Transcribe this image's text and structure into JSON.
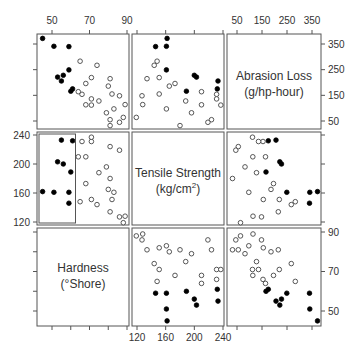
{
  "chart_data": {
    "type": "scatter",
    "subtype": "scatterplot-matrix",
    "title": "",
    "variables": [
      {
        "key": "hardness",
        "label": "Hardness",
        "unit_label": "(°Shore)",
        "ticks": [
          50,
          70,
          90
        ],
        "range": [
          42,
          92
        ]
      },
      {
        "key": "tensile",
        "label": "Tensile Strength",
        "unit_label": "(kg/cm²)",
        "ticks": [
          120,
          160,
          200,
          240
        ],
        "range": [
          112,
          245
        ]
      },
      {
        "key": "abrasion",
        "label": "Abrasion Loss",
        "unit_label": "(g/hp-hour)",
        "ticks": [
          50,
          150,
          250,
          350
        ],
        "range": [
          20,
          390
        ]
      }
    ],
    "diagonal_order": [
      "abrasion",
      "tensile",
      "hardness"
    ],
    "column_order": [
      "hardness",
      "tensile",
      "abrasion"
    ],
    "brush": {
      "variable": "hardness",
      "max": 62,
      "panel": "tensile-vs-hardness"
    },
    "point_style": {
      "selected": "filled",
      "unselected": "open"
    },
    "points": [
      {
        "abrasion": 372,
        "hardness": 45,
        "tensile": 162
      },
      {
        "abrasion": 206,
        "hardness": 55,
        "tensile": 233
      },
      {
        "abrasion": 175,
        "hardness": 61,
        "tensile": 232
      },
      {
        "abrasion": 154,
        "hardness": 66,
        "tensile": 231
      },
      {
        "abrasion": 136,
        "hardness": 71,
        "tensile": 231
      },
      {
        "abrasion": 112,
        "hardness": 71,
        "tensile": 237
      },
      {
        "abrasion": 55,
        "hardness": 81,
        "tensile": 224
      },
      {
        "abrasion": 45,
        "hardness": 86,
        "tensile": 219
      },
      {
        "abrasion": 221,
        "hardness": 53,
        "tensile": 203
      },
      {
        "abrasion": 166,
        "hardness": 60,
        "tensile": 189
      },
      {
        "abrasion": 164,
        "hardness": 64,
        "tensile": 210
      },
      {
        "abrasion": 113,
        "hardness": 68,
        "tensile": 210
      },
      {
        "abrasion": 82,
        "hardness": 79,
        "tensile": 196
      },
      {
        "abrasion": 32,
        "hardness": 81,
        "tensile": 180
      },
      {
        "abrasion": 228,
        "hardness": 56,
        "tensile": 200
      },
      {
        "abrasion": 196,
        "hardness": 68,
        "tensile": 173
      },
      {
        "abrasion": 128,
        "hardness": 75,
        "tensile": 188
      },
      {
        "abrasion": 97,
        "hardness": 83,
        "tensile": 161
      },
      {
        "abrasion": 64,
        "hardness": 88,
        "tensile": 119
      },
      {
        "abrasion": 249,
        "hardness": 59,
        "tensile": 161
      },
      {
        "abrasion": 219,
        "hardness": 71,
        "tensile": 151
      },
      {
        "abrasion": 186,
        "hardness": 80,
        "tensile": 165
      },
      {
        "abrasion": 155,
        "hardness": 82,
        "tensile": 151
      },
      {
        "abrasion": 114,
        "hardness": 89,
        "tensile": 128
      },
      {
        "abrasion": 341,
        "hardness": 51,
        "tensile": 161
      },
      {
        "abrasion": 340,
        "hardness": 59,
        "tensile": 146
      },
      {
        "abrasion": 283,
        "hardness": 65,
        "tensile": 148
      },
      {
        "abrasion": 267,
        "hardness": 74,
        "tensile": 144
      },
      {
        "abrasion": 215,
        "hardness": 81,
        "tensile": 134
      },
      {
        "abrasion": 148,
        "hardness": 86,
        "tensile": 127
      }
    ],
    "xlabel": "",
    "ylabel": "",
    "grid": false,
    "legend": "none"
  },
  "labels": {
    "abrasion_line1": "Abrasion Loss",
    "abrasion_line2": "(g/hp-hour)",
    "tensile_line1": "Tensile Strength",
    "tensile_line2_base": "(kg/cm",
    "tensile_line2_sup": "2",
    "tensile_line2_end": ")",
    "hardness_line1": "Hardness",
    "hardness_line2": "(°Shore)"
  }
}
